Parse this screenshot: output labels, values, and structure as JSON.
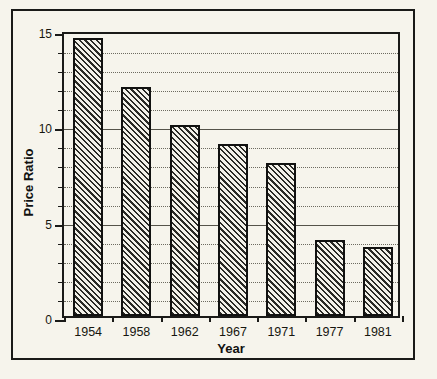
{
  "chart_data": {
    "type": "bar",
    "title": "",
    "xlabel": "Year",
    "ylabel": "Price Ratio",
    "categories": [
      "1954",
      "1958",
      "1962",
      "1967",
      "1971",
      "1977",
      "1981"
    ],
    "values": [
      14.6,
      12.0,
      10.0,
      9.0,
      8.0,
      4.0,
      3.6
    ],
    "ylim": [
      0,
      15
    ],
    "ytick_labels": [
      "0",
      "5",
      "10",
      "15"
    ],
    "ytick_values": [
      0,
      5,
      10,
      15
    ],
    "minor_tick_interval": 1,
    "grid": "horizontal-dotted",
    "legend": "none",
    "bar_fill": "diagonal-hatch",
    "colors": {
      "background": "#f6f4ec",
      "axis": "#1a1a18",
      "bar_edge": "#111110",
      "bar_hatch": "#2a2a26",
      "gridline": "#6d6b60",
      "text": "#16160f"
    }
  },
  "axes": {
    "y_axis_label": "Price Ratio",
    "x_axis_label": "Year"
  }
}
